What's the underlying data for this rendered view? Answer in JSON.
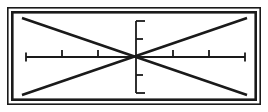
{
  "figure": {
    "title": "Coordinate axis cross inside double-ruled rectangular frame",
    "type": "line-art-diagram",
    "canvas": {
      "width": 268,
      "height": 112
    },
    "colors": {
      "background": "#ffffff",
      "ink": "#1a1a1a",
      "frame": "#1a1a1a"
    },
    "frame": {
      "name": "double-rule-border",
      "outer": {
        "x": 7,
        "y": 7,
        "width": 254,
        "height": 98,
        "stroke_width": 1.6
      },
      "inner": {
        "x": 11,
        "y": 11,
        "width": 246,
        "height": 90,
        "stroke_width": 2.6
      }
    },
    "diagonals": {
      "name": "x-cross",
      "stroke_width": 2.6,
      "lines": [
        {
          "label": "top-left-to-bottom-right",
          "x1": 22,
          "y1": 18,
          "x2": 247,
          "y2": 95
        },
        {
          "label": "bottom-left-to-top-right",
          "x1": 22,
          "y1": 95,
          "x2": 247,
          "y2": 18
        }
      ]
    },
    "axes": {
      "origin": {
        "x": 136,
        "y": 57
      },
      "stroke_width": 1.8,
      "horizontal": {
        "name": "x-axis",
        "x_start": 26,
        "x_end": 245,
        "y": 57,
        "tick_direction": "up",
        "tick_length": 7,
        "end_serif_length": 9,
        "ticks": [
          62,
          98,
          173,
          209
        ],
        "end_caps": [
          26,
          245
        ]
      },
      "vertical": {
        "name": "y-axis",
        "y_start": 21,
        "y_end": 93,
        "x": 136,
        "tick_direction": "right",
        "tick_length": 7,
        "end_serif_length": 9,
        "ticks": [
          39,
          75
        ],
        "end_caps": [
          21,
          93
        ]
      }
    }
  }
}
